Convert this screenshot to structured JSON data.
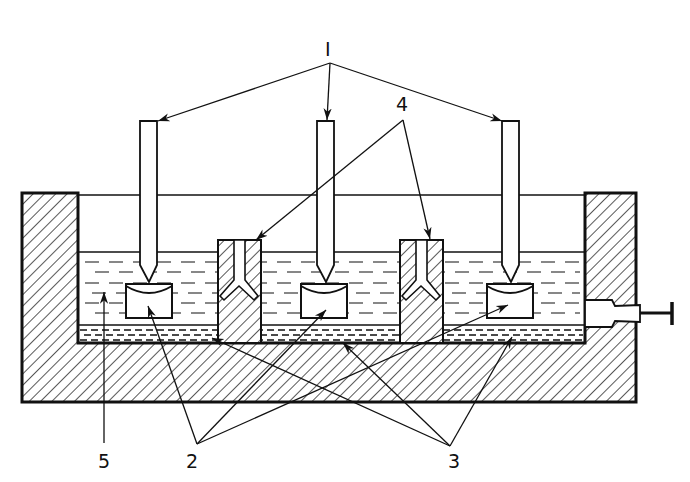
{
  "diagram": {
    "type": "technical cross-section schematic",
    "colors": {
      "line": "#111111",
      "background": "#ffffff"
    },
    "labels": [
      {
        "id": "1",
        "text": "I",
        "x": 324,
        "y": 22,
        "points_to": [
          "left probe",
          "center probe",
          "right probe"
        ]
      },
      {
        "id": "4",
        "text": "4",
        "x": 394,
        "y": 90,
        "points_to": [
          "left partition channel",
          "right partition channel"
        ]
      },
      {
        "id": "5",
        "text": "5",
        "x": 97,
        "y": 451,
        "points_to": [
          "liquid bath"
        ]
      },
      {
        "id": "2",
        "text": "2",
        "x": 186,
        "y": 451,
        "points_to": [
          "left sample cup",
          "center sample cup",
          "right sample cup"
        ]
      },
      {
        "id": "3",
        "text": "3",
        "x": 447,
        "y": 451,
        "points_to": [
          "left bottom layer",
          "center bottom layer",
          "right bottom layer"
        ]
      }
    ],
    "components": {
      "vessel": "hatched outer container",
      "probes": 3,
      "sample_cups": 3,
      "partitions": 2,
      "drain_valve": "right side"
    }
  }
}
